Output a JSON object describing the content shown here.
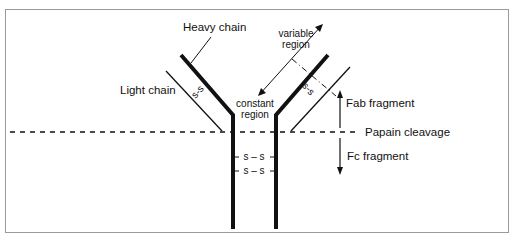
{
  "diagram": {
    "labels": {
      "heavy_chain": "Heavy chain",
      "light_chain": "Light chain",
      "variable_region_line1": "variable",
      "variable_region_line2": "region",
      "constant_region_line1": "constant",
      "constant_region_line2": "region",
      "fab_fragment": "Fab fragment",
      "papain_cleavage": "Papain cleavage",
      "fc_fragment": "Fc fragment",
      "disulfide_left_arm": "s-s",
      "disulfide_right_arm": "s-s",
      "disulfide_hinge_1": "s – s",
      "disulfide_hinge_2": "s – s"
    },
    "colors": {
      "line": "#111111",
      "frame": "#9a9a9a",
      "background": "#ffffff"
    }
  }
}
